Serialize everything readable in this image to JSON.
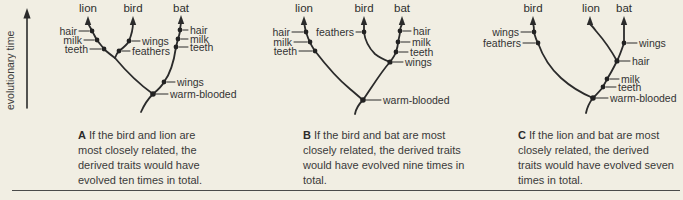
{
  "figure": {
    "axis_label": "evolutionary time"
  },
  "colors": {
    "background": "#f1eee3",
    "line": "#2b2b2b",
    "text": "#3a3a3a"
  },
  "trees": {
    "a": {
      "taxa": {
        "left": "lion",
        "middle": "bird",
        "right": "bat"
      },
      "labels": {
        "hair_lion": "hair",
        "milk_lion": "milk",
        "teeth_lion": "teeth",
        "wings_bird": "wings",
        "feathers_bird": "feathers",
        "hair_bat": "hair",
        "milk_bat": "milk",
        "teeth_bat": "teeth",
        "wings_bat": "wings",
        "warm_blooded": "warm-blooded"
      },
      "caption_letter": "A",
      "caption_text": "If the bird and lion are most closely related, the derived traits would have evolved ten times in total."
    },
    "b": {
      "taxa": {
        "left": "lion",
        "middle": "bird",
        "right": "bat"
      },
      "labels": {
        "hair_lion": "hair",
        "milk_lion": "milk",
        "teeth_lion": "teeth",
        "feathers_bird": "feathers",
        "hair_bat": "hair",
        "milk_bat": "milk",
        "teeth_bat": "teeth",
        "wings_shared": "wings",
        "warm_blooded": "warm-blooded"
      },
      "caption_letter": "B",
      "caption_text": "If the bird and bat are most closely related, the derived traits would have evolved nine times in total."
    },
    "c": {
      "taxa": {
        "left": "bird",
        "middle": "lion",
        "right": "bat"
      },
      "labels": {
        "wings_bird": "wings",
        "feathers_bird": "feathers",
        "wings_bat": "wings",
        "hair_shared": "hair",
        "milk_shared": "milk",
        "teeth_shared": "teeth",
        "warm_blooded": "warm-blooded"
      },
      "caption_letter": "C",
      "caption_text": "If the lion and bat are most closely related, the derived traits would have evolved seven times in total."
    }
  }
}
